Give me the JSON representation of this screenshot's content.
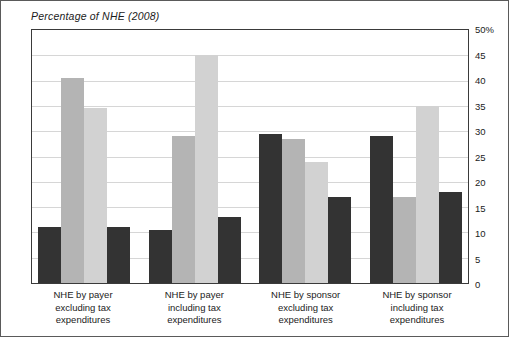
{
  "chart_data": {
    "type": "bar",
    "title": "Percentage of NHE (2008)",
    "xlabel": "",
    "ylabel": "",
    "ylim": [
      0,
      50
    ],
    "ytick_values": [
      50,
      45,
      40,
      35,
      30,
      25,
      20,
      15,
      10,
      5,
      0
    ],
    "ytick_labels": [
      "50%",
      "45",
      "40",
      "35",
      "30",
      "25",
      "20",
      "15",
      "10",
      "5",
      "0"
    ],
    "grid": true,
    "legend": "none",
    "categories": [
      "NHE by payer excluding tax expenditures",
      "NHE by payer including tax expenditures",
      "NHE by sponsor excluding tax expenditures",
      "NHE by sponsor including tax expenditures"
    ],
    "category_lines": [
      [
        "NHE by payer",
        "excluding tax",
        "expenditures"
      ],
      [
        "NHE by payer",
        "including tax",
        "expenditures"
      ],
      [
        "NHE by sponsor",
        "excluding tax",
        "expenditures"
      ],
      [
        "NHE by sponsor",
        "including tax",
        "expenditures"
      ]
    ],
    "series": [
      {
        "name": "series-1",
        "color": "#333333",
        "values": [
          11,
          10.5,
          29.5,
          29
        ]
      },
      {
        "name": "series-2",
        "color": "#b4b4b4",
        "values": [
          40.5,
          29,
          28.5,
          17
        ]
      },
      {
        "name": "series-3",
        "color": "#d2d2d2",
        "values": [
          34.5,
          45,
          24,
          35
        ]
      },
      {
        "name": "series-4",
        "color": "#333333",
        "values": [
          11,
          13,
          17,
          18
        ]
      }
    ],
    "groups": [
      {
        "category": "NHE by payer excluding tax expenditures",
        "bars": [
          {
            "value": 11,
            "color": "#333333"
          },
          {
            "value": 40.5,
            "color": "#b4b4b4"
          },
          {
            "value": 34.5,
            "color": "#d2d2d2"
          },
          {
            "value": 11,
            "color": "#333333"
          }
        ]
      },
      {
        "category": "NHE by payer including tax expenditures",
        "bars": [
          {
            "value": 10.5,
            "color": "#333333"
          },
          {
            "value": 29,
            "color": "#b4b4b4"
          },
          {
            "value": 45,
            "color": "#d2d2d2"
          },
          {
            "value": 13,
            "color": "#333333"
          }
        ]
      },
      {
        "category": "NHE by sponsor excluding tax expenditures",
        "bars": [
          {
            "value": 29.5,
            "color": "#333333"
          },
          {
            "value": 28.5,
            "color": "#b4b4b4"
          },
          {
            "value": 24,
            "color": "#d2d2d2"
          },
          {
            "value": 17,
            "color": "#333333"
          }
        ]
      },
      {
        "category": "NHE by sponsor including tax expenditures",
        "bars": [
          {
            "value": 29,
            "color": "#333333"
          },
          {
            "value": 17,
            "color": "#b4b4b4"
          },
          {
            "value": 35,
            "color": "#d2d2d2"
          },
          {
            "value": 18,
            "color": "#333333"
          }
        ]
      }
    ]
  },
  "colors": {
    "dark_bar": "#333333",
    "medium_bar": "#b4b4b4",
    "light_bar": "#d2d2d2",
    "gridline": "#d6d6d6",
    "axis": "#3a3a3a",
    "frame": "#5a5a5a",
    "text": "#1b1b1b"
  }
}
